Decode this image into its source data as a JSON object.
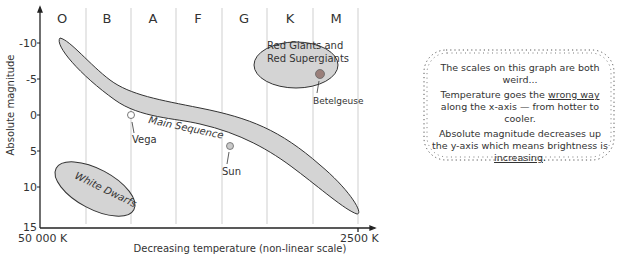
{
  "diagram": {
    "spectral_classes": [
      "O",
      "B",
      "A",
      "F",
      "G",
      "K",
      "M"
    ],
    "y_axis": {
      "label": "Absolute magnitude",
      "ticks": [
        "-10",
        "-5",
        "0",
        "5",
        "10",
        "15"
      ]
    },
    "x_axis": {
      "label": "Decreasing temperature (non-linear scale)",
      "left_label": "50 000 K",
      "right_label": "2500 K"
    },
    "regions": {
      "main_sequence": "Main Sequence",
      "red_giants_line1": "Red Giants and",
      "red_giants_line2": "Red Supergiants",
      "white_dwarfs": "White Dwarfs"
    },
    "stars": {
      "vega": "Vega",
      "sun": "Sun",
      "betelgeuse": "Betelgeuse"
    },
    "colors": {
      "region_fill": "#d4d4d4",
      "betelgeuse": "#9a7f7a",
      "sun": "#c9c9c9",
      "vega": "#ffffff",
      "grid": "#cfcfcf"
    }
  },
  "note": {
    "line1": "The scales on this graph are both weird...",
    "line2_a": "Temperature goes the ",
    "line2_u": "wrong way",
    "line2_b": " along the x-axis — from hotter to cooler.",
    "line3_a": "Absolute magnitude decreases up the y-axis which means brightness is ",
    "line3_u": "increasing",
    "line3_b": "."
  }
}
